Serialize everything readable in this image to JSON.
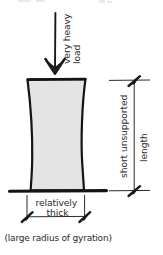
{
  "figure": {
    "background_color": "#ffffff",
    "ink_color": "#1a1a1a",
    "column_fill_color": "#e4e4e4",
    "width": 163,
    "height": 255
  },
  "labels": {
    "load": "very heavy load",
    "load_line1": "very heavy",
    "load_line2": "load",
    "length_line1": "short unsupported",
    "length_line2": "length",
    "thickness_line1": "relatively",
    "thickness_line2": "thick",
    "note": "(large radius of gyration)"
  },
  "annotations": {
    "load_arrow": "downward-load-arrow",
    "length_dimension": "vertical-dimension-line",
    "thickness_dimension": "horizontal-dimension-line",
    "base": "ground-support-line",
    "column": "bulging-short-column"
  },
  "clipped_top_text": ""
}
